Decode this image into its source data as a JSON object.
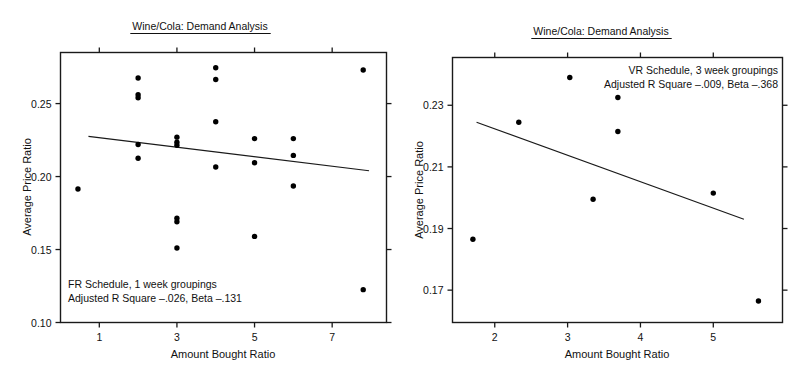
{
  "figure": {
    "background": "#ffffff",
    "ink_color": "#111111",
    "point_color": "#000000"
  },
  "chart_data": [
    {
      "id": "left",
      "type": "scatter",
      "title": "Wine/Cola: Demand Analysis",
      "xlabel": "Amount Bought Ratio",
      "ylabel": "Average Price Ratio",
      "xlim": [
        0.0,
        8.4
      ],
      "ylim": [
        0.1,
        0.285
      ],
      "xticks": [
        1,
        3,
        5,
        7
      ],
      "xticklabels": [
        "1",
        "3",
        "5",
        "7"
      ],
      "yticks": [
        0.1,
        0.15,
        0.2,
        0.25
      ],
      "yticklabels": [
        "0.10",
        "0.15",
        "0.20",
        "0.25"
      ],
      "grid": false,
      "legend": "none",
      "annotation": [
        "FR Schedule, 1 week groupings",
        "Adjusted R Square –.026, Beta –.131"
      ],
      "annotation_stats": {
        "schedule": "FR Schedule",
        "grouping": "1 week groupings",
        "adjusted_r_square": "-.026",
        "beta": "-.131"
      },
      "points": [
        {
          "x": 0.45,
          "y": 0.1915
        },
        {
          "x": 2.0,
          "y": 0.2675
        },
        {
          "x": 2.0,
          "y": 0.256
        },
        {
          "x": 2.0,
          "y": 0.254
        },
        {
          "x": 2.0,
          "y": 0.222
        },
        {
          "x": 2.0,
          "y": 0.2125
        },
        {
          "x": 3.0,
          "y": 0.227
        },
        {
          "x": 3.0,
          "y": 0.2235
        },
        {
          "x": 3.0,
          "y": 0.2215
        },
        {
          "x": 3.0,
          "y": 0.1715
        },
        {
          "x": 3.0,
          "y": 0.169
        },
        {
          "x": 3.0,
          "y": 0.151
        },
        {
          "x": 4.0,
          "y": 0.2745
        },
        {
          "x": 4.0,
          "y": 0.2665
        },
        {
          "x": 4.0,
          "y": 0.2375
        },
        {
          "x": 4.0,
          "y": 0.2065
        },
        {
          "x": 5.0,
          "y": 0.226
        },
        {
          "x": 5.0,
          "y": 0.2095
        },
        {
          "x": 5.0,
          "y": 0.159
        },
        {
          "x": 6.0,
          "y": 0.226
        },
        {
          "x": 6.0,
          "y": 0.2145
        },
        {
          "x": 6.0,
          "y": 0.1935
        },
        {
          "x": 7.8,
          "y": 0.273
        },
        {
          "x": 7.8,
          "y": 0.1225
        }
      ],
      "fit_line": {
        "x0": 0.72,
        "y0": 0.2275,
        "x1": 7.95,
        "y1": 0.204
      }
    },
    {
      "id": "right",
      "type": "scatter",
      "title": "Wine/Cola: Demand Analysis",
      "xlabel": "Amount Bought Ratio",
      "ylabel": "Average Price Ratio",
      "xlim": [
        1.42,
        5.95
      ],
      "ylim": [
        0.1595,
        0.2455
      ],
      "xticks": [
        2,
        3,
        4,
        5
      ],
      "xticklabels": [
        "2",
        "3",
        "4",
        "5"
      ],
      "yticks": [
        0.17,
        0.19,
        0.21,
        0.23
      ],
      "yticklabels": [
        "0.17",
        "0.19",
        "0.21",
        "0.23"
      ],
      "grid": false,
      "legend": "none",
      "annotation": [
        "VR Schedule, 3 week groupings",
        "Adjusted R Square –.009, Beta –.368"
      ],
      "annotation_stats": {
        "schedule": "VR Schedule",
        "grouping": "3 week groupings",
        "adjusted_r_square": "-.009",
        "beta": "-.368"
      },
      "points": [
        {
          "x": 1.7,
          "y": 0.1865
        },
        {
          "x": 2.33,
          "y": 0.2245
        },
        {
          "x": 3.03,
          "y": 0.239
        },
        {
          "x": 3.35,
          "y": 0.1995
        },
        {
          "x": 3.69,
          "y": 0.2325
        },
        {
          "x": 3.69,
          "y": 0.2215
        },
        {
          "x": 5.0,
          "y": 0.2015
        },
        {
          "x": 5.62,
          "y": 0.1665
        }
      ],
      "fit_line": {
        "x0": 1.75,
        "y0": 0.2245,
        "x1": 5.42,
        "y1": 0.193
      }
    }
  ]
}
